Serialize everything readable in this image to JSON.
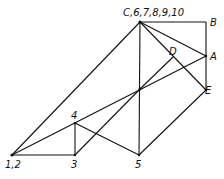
{
  "diagram": {
    "type": "mechanism/force-polygon line diagram",
    "colors": {
      "line": "#111111",
      "background": "#ffffff"
    },
    "nodes": [
      {
        "id": "C",
        "label": "C,6,7,8,9,10",
        "x": 140,
        "y": 22
      },
      {
        "id": "B",
        "label": "B",
        "x": 206,
        "y": 22
      },
      {
        "id": "A",
        "label": "A",
        "x": 206,
        "y": 56
      },
      {
        "id": "D",
        "label": "D",
        "x": 173,
        "y": 57
      },
      {
        "id": "E",
        "label": "E",
        "x": 206,
        "y": 90
      },
      {
        "id": "O",
        "label": "",
        "x": 140,
        "y": 89
      },
      {
        "id": "4",
        "label": "4",
        "x": 75,
        "y": 123
      },
      {
        "id": "12",
        "label": "1,2",
        "x": 12,
        "y": 155
      },
      {
        "id": "3",
        "label": "3",
        "x": 75,
        "y": 155
      },
      {
        "id": "5",
        "label": "5",
        "x": 139,
        "y": 155
      }
    ],
    "edges": [
      [
        "C",
        "B"
      ],
      [
        "B",
        "A"
      ],
      [
        "A",
        "E"
      ],
      [
        "C",
        "A"
      ],
      [
        "C",
        "E"
      ],
      [
        "C",
        "5"
      ],
      [
        "O",
        "D"
      ],
      [
        "12",
        "A"
      ],
      [
        "12",
        "C"
      ],
      [
        "12",
        "3"
      ],
      [
        "3",
        "4"
      ],
      [
        "3",
        "O"
      ],
      [
        "4",
        "5"
      ],
      [
        "5",
        "E"
      ]
    ],
    "labels": {
      "C": "C,6,7,8,9,10",
      "B": "B",
      "A": "A",
      "D": "D",
      "E": "E",
      "n4": "4",
      "n12": "1,2",
      "n3": "3",
      "n5": "5"
    }
  }
}
